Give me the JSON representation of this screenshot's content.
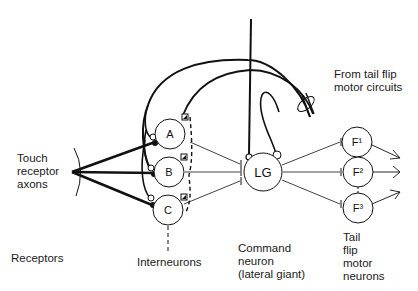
{
  "diagram": {
    "labels": {
      "touch_receptor_axons": [
        "Touch",
        "receptor",
        "axons"
      ],
      "from_tail_flip": [
        "From tail flip",
        "motor circuits"
      ],
      "receptors": "Receptors",
      "interneurons": "Interneurons",
      "command_neuron": [
        "Command",
        "neuron",
        "(lateral giant)"
      ],
      "tail_flip_motor_neurons": [
        "Tail",
        "flip",
        "motor",
        "neurons"
      ]
    },
    "nodes": {
      "A": "A",
      "B": "B",
      "C": "C",
      "LG": "LG",
      "F1": "F¹",
      "F2": "F²",
      "F3": "F³"
    },
    "colors": {
      "line": "#111111",
      "background": "#ffffff"
    }
  }
}
